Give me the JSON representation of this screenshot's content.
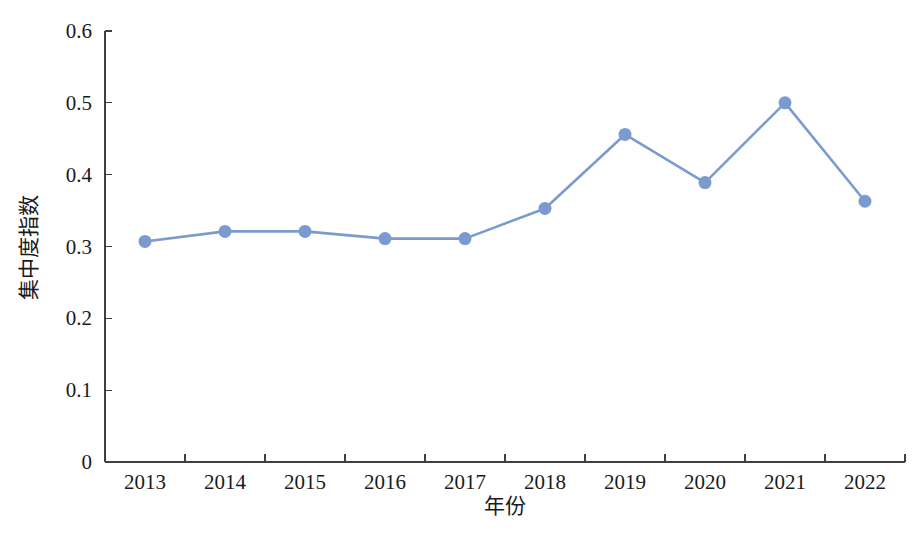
{
  "figure": {
    "background_color": "#ffffff",
    "crop_strip_top_text": "",
    "crop_strip_bottom_text": ""
  },
  "chart_data": {
    "type": "line",
    "title": "",
    "subtitle": "",
    "xlabel": "年份",
    "ylabel": "集中度指数",
    "categories": [
      "2013",
      "2014",
      "2015",
      "2016",
      "2017",
      "2018",
      "2019",
      "2020",
      "2021",
      "2022"
    ],
    "x": [
      2013,
      2014,
      2015,
      2016,
      2017,
      2018,
      2019,
      2020,
      2021,
      2022
    ],
    "series": [
      {
        "name": "集中度指数",
        "color": "#7b9bd0",
        "marker": "circle",
        "values": [
          0.307,
          0.321,
          0.321,
          0.311,
          0.311,
          0.353,
          0.456,
          0.389,
          0.5,
          0.363
        ]
      }
    ],
    "values": [
      0.307,
      0.321,
      0.321,
      0.311,
      0.311,
      0.353,
      0.456,
      0.389,
      0.5,
      0.363
    ],
    "ylim": [
      0,
      0.6
    ],
    "ytick_values": [
      0,
      0.1,
      0.2,
      0.3,
      0.4,
      0.5,
      0.6
    ],
    "ytick_labels": [
      "0",
      "0.1",
      "0.2",
      "0.3",
      "0.4",
      "0.5",
      "0.6"
    ],
    "xtick_labels": [
      "2013",
      "2014",
      "2015",
      "2016",
      "2017",
      "2018",
      "2019",
      "2020",
      "2021",
      "2022"
    ],
    "grid": false,
    "legend": false,
    "legend_position": "none",
    "axis_color": "#3f3f3f",
    "annotations": []
  }
}
